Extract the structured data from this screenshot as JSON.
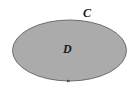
{
  "diagram": {
    "type": "region-with-boundary",
    "region": {
      "label": "D",
      "fill_color": "#ababab",
      "shape": "ellipse"
    },
    "boundary": {
      "label": "C",
      "stroke_color": "#6e6e6e",
      "orientation_marker": "arrowhead-at-bottom"
    },
    "background_color": "#ffffff"
  }
}
